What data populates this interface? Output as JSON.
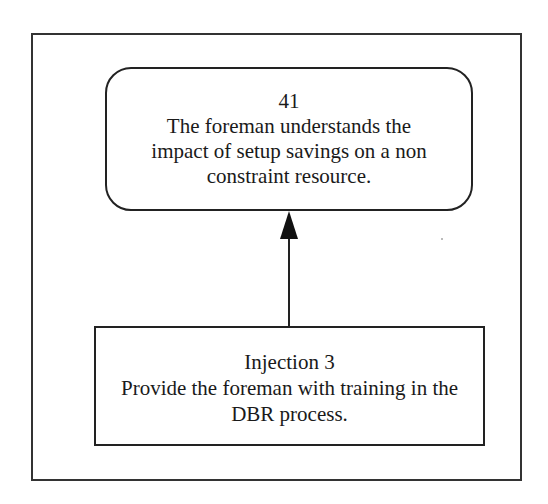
{
  "diagram": {
    "top_node": {
      "id_label": "41",
      "lines": [
        "The foreman understands the",
        "impact of setup savings on a non",
        "constraint resource."
      ],
      "shape": "rounded-rectangle"
    },
    "bottom_node": {
      "title": "Injection 3",
      "lines": [
        "Provide the foreman with training in the",
        "DBR process."
      ],
      "shape": "rectangle"
    },
    "edges": [
      {
        "from": "bottom_node",
        "to": "top_node",
        "type": "arrow"
      }
    ],
    "colors": {
      "stroke": "#222222",
      "background": "#ffffff",
      "text": "#1a1a1a"
    }
  }
}
